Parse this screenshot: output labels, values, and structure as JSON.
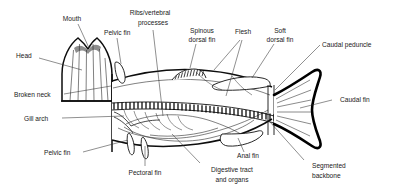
{
  "figure": {
    "style": "black and white line drawing",
    "background_color": "#ffffff",
    "line_color": "#000000",
    "text_color": "#1a1a1a"
  },
  "labels": {
    "mouth": "Mouth",
    "head": "Head",
    "pelvic_fin_top": "Pelvic fin",
    "ribs_vertebral_line1": "Ribs/vertebral",
    "ribs_vertebral_line2": "processes",
    "spinous_dorsal_line1": "Spinous",
    "spinous_dorsal_line2": "dorsal fin",
    "flesh": "Flesh",
    "soft_dorsal_line1": "Soft",
    "soft_dorsal_line2": "dorsal fin",
    "caudal_peduncle": "Caudal peduncle",
    "caudal_fin": "Caudal fin",
    "broken_neck": "Broken neck",
    "gill_arch": "Gill arch",
    "pelvic_fin_bottom": "Pelvic fin",
    "pectoral_fin": "Pectoral fin",
    "digestive_line1": "Digestive tract",
    "digestive_line2": "and organs",
    "anal_fin": "Anal fin",
    "segmented_line1": "Segmented",
    "segmented_line2": "backbone"
  },
  "parts": [
    {
      "id": "mouth",
      "name": "Mouth"
    },
    {
      "id": "head",
      "name": "Head"
    },
    {
      "id": "pelvic-fin-upper",
      "name": "Pelvic fin"
    },
    {
      "id": "ribs-vertebral-processes",
      "name": "Ribs/vertebral processes"
    },
    {
      "id": "spinous-dorsal-fin",
      "name": "Spinous dorsal fin"
    },
    {
      "id": "flesh",
      "name": "Flesh"
    },
    {
      "id": "soft-dorsal-fin",
      "name": "Soft dorsal fin"
    },
    {
      "id": "caudal-peduncle",
      "name": "Caudal peduncle"
    },
    {
      "id": "caudal-fin",
      "name": "Caudal fin"
    },
    {
      "id": "broken-neck",
      "name": "Broken neck"
    },
    {
      "id": "gill-arch",
      "name": "Gill arch"
    },
    {
      "id": "pelvic-fin-lower",
      "name": "Pelvic fin"
    },
    {
      "id": "pectoral-fin",
      "name": "Pectoral fin"
    },
    {
      "id": "digestive-tract",
      "name": "Digestive tract and organs"
    },
    {
      "id": "anal-fin",
      "name": "Anal fin"
    },
    {
      "id": "segmented-backbone",
      "name": "Segmented backbone"
    }
  ]
}
